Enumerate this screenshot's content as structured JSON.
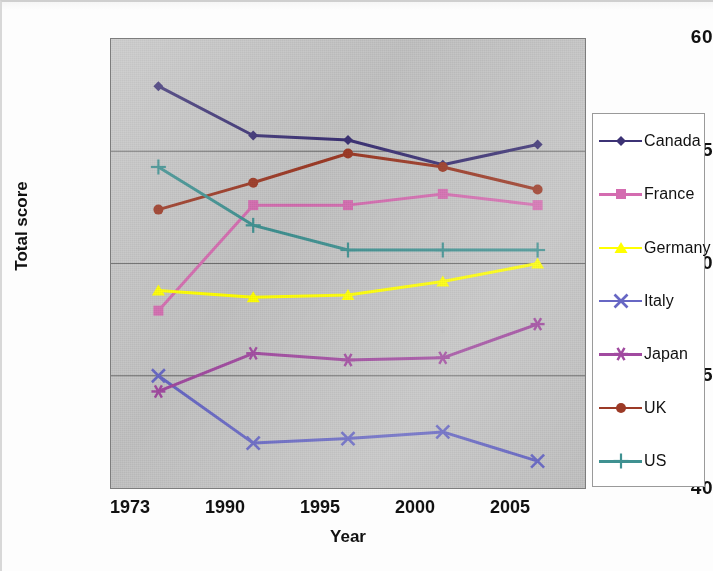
{
  "chart_data": {
    "type": "line",
    "title": "",
    "xlabel": "Year",
    "ylabel": "Total score",
    "categories": [
      "1973",
      "1990",
      "1995",
      "2000",
      "2005"
    ],
    "ylim": [
      40,
      60
    ],
    "yticks": [
      "40",
      "45",
      "50",
      "55",
      "60"
    ],
    "grid": "horizontal",
    "legend_position": "right",
    "series": [
      {
        "name": "Canada",
        "marker": "diamond",
        "color": "#3c3275",
        "values": [
          57.9,
          55.7,
          55.5,
          54.4,
          55.3
        ]
      },
      {
        "name": "France",
        "marker": "square",
        "color": "#d46cb0",
        "values": [
          47.9,
          52.6,
          52.6,
          53.1,
          52.6
        ]
      },
      {
        "name": "Germany",
        "marker": "triangle",
        "color": "#ffff00",
        "values": [
          48.8,
          48.5,
          48.6,
          49.2,
          50.0
        ]
      },
      {
        "name": "Italy",
        "marker": "x",
        "color": "#6767c4",
        "values": [
          45.0,
          42.0,
          42.2,
          42.5,
          41.2
        ]
      },
      {
        "name": "Japan",
        "marker": "star",
        "color": "#a14aa0",
        "values": [
          44.3,
          46.0,
          45.7,
          45.8,
          47.3
        ]
      },
      {
        "name": "UK",
        "marker": "circle",
        "color": "#9c3a26",
        "values": [
          52.4,
          53.6,
          54.9,
          54.3,
          53.3
        ]
      },
      {
        "name": "US",
        "marker": "plus",
        "color": "#3f9191",
        "values": [
          54.3,
          51.7,
          50.6,
          50.6,
          50.6
        ]
      }
    ]
  },
  "axes": {
    "ylabel": "Total score",
    "xlabel": "Year",
    "yticks": [
      "60",
      "55",
      "50",
      "45",
      "40"
    ],
    "xticks": [
      "1973",
      "1990",
      "1995",
      "2000",
      "2005"
    ]
  },
  "legend": {
    "items": [
      {
        "label": "Canada",
        "color": "#3c3275",
        "marker": "diamond-marker"
      },
      {
        "label": "France",
        "color": "#d46cb0",
        "marker": "square-marker"
      },
      {
        "label": "Germany",
        "color": "#ffff00",
        "marker": "triangle-marker"
      },
      {
        "label": "Italy",
        "color": "#6767c4",
        "marker": "x-marker"
      },
      {
        "label": "Japan",
        "color": "#a14aa0",
        "marker": "star-marker"
      },
      {
        "label": "UK",
        "color": "#9c3a26",
        "marker": "circle-marker"
      },
      {
        "label": "US",
        "color": "#3f9191",
        "marker": "plus-marker"
      }
    ]
  },
  "colors": {
    "plot_background": "#c3c3c3",
    "page_background": "#fdfdfd",
    "gridline": "#5a5a5a",
    "axis_text": "#111111"
  }
}
